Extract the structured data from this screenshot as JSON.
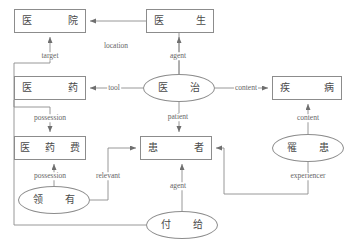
{
  "diagram": {
    "colors": {
      "stroke": "#8c8c8c",
      "node_text": "#4a4a4a",
      "label_text": "#666666",
      "background": "#ffffff"
    },
    "nodes": [
      {
        "id": "hospital",
        "shape": "box",
        "text": "医 院",
        "chars": [
          "医",
          "院"
        ],
        "x": 14,
        "y": 9,
        "w": 72,
        "h": 24
      },
      {
        "id": "doctor",
        "shape": "box",
        "text": "医 生",
        "chars": [
          "医",
          "生"
        ],
        "x": 146,
        "y": 9,
        "w": 68,
        "h": 24
      },
      {
        "id": "medicine",
        "shape": "box",
        "text": "医 药",
        "chars": [
          "医",
          "药"
        ],
        "x": 14,
        "y": 76,
        "w": 72,
        "h": 24
      },
      {
        "id": "treat",
        "shape": "ellipse",
        "text": "医 治",
        "chars": [
          "医",
          "治"
        ],
        "x": 143,
        "y": 74,
        "w": 72,
        "h": 28
      },
      {
        "id": "disease",
        "shape": "box",
        "text": "疾 病",
        "chars": [
          "疾",
          "病"
        ],
        "x": 272,
        "y": 76,
        "w": 70,
        "h": 24
      },
      {
        "id": "medfee",
        "shape": "box",
        "text": "医 药 费",
        "chars": [
          "医",
          "药",
          "费"
        ],
        "x": 14,
        "y": 136,
        "w": 72,
        "h": 24
      },
      {
        "id": "patientn",
        "shape": "box",
        "text": "患 者",
        "chars": [
          "患",
          "者"
        ],
        "x": 140,
        "y": 136,
        "w": 72,
        "h": 24
      },
      {
        "id": "suffer",
        "shape": "ellipse",
        "text": "罹 患",
        "chars": [
          "罹",
          "患"
        ],
        "x": 272,
        "y": 134,
        "w": 72,
        "h": 28
      },
      {
        "id": "possess",
        "shape": "ellipse",
        "text": "领 有",
        "chars": [
          "领",
          "有"
        ],
        "x": 18,
        "y": 186,
        "w": 72,
        "h": 28
      },
      {
        "id": "payto",
        "shape": "ellipse",
        "text": "付 给",
        "chars": [
          "付",
          "给"
        ],
        "x": 146,
        "y": 211,
        "w": 72,
        "h": 28
      }
    ],
    "edge_labels": [
      {
        "id": "target",
        "text": "target",
        "x": 50,
        "y": 56
      },
      {
        "id": "location",
        "text": "location",
        "x": 116,
        "y": 46
      },
      {
        "id": "agent-top",
        "text": "agent",
        "x": 178,
        "y": 56
      },
      {
        "id": "tool",
        "text": "tool",
        "x": 114,
        "y": 88
      },
      {
        "id": "content-mid",
        "text": "content",
        "x": 246,
        "y": 88
      },
      {
        "id": "patient",
        "text": "patient",
        "x": 178,
        "y": 117
      },
      {
        "id": "possession1",
        "text": "possession",
        "x": 50,
        "y": 118
      },
      {
        "id": "content-rt",
        "text": "content",
        "x": 308,
        "y": 118
      },
      {
        "id": "possession2",
        "text": "possession",
        "x": 50,
        "y": 176
      },
      {
        "id": "relevant",
        "text": "relevant",
        "x": 108,
        "y": 176
      },
      {
        "id": "agent-bot",
        "text": "agent",
        "x": 178,
        "y": 186
      },
      {
        "id": "experiencer",
        "text": "experiencer",
        "x": 308,
        "y": 176
      }
    ],
    "edges": [
      {
        "id": "treat-to-hospital",
        "label": "location",
        "from": "treat",
        "to": "hospital"
      },
      {
        "id": "payto-to-hospital",
        "label": "target",
        "from": "payto",
        "to": "hospital"
      },
      {
        "id": "treat-to-doctor",
        "label": "agent",
        "from": "treat",
        "to": "doctor"
      },
      {
        "id": "treat-to-medicine",
        "label": "tool",
        "from": "treat",
        "to": "medicine"
      },
      {
        "id": "treat-to-disease",
        "label": "content",
        "from": "treat",
        "to": "disease"
      },
      {
        "id": "treat-to-patient",
        "label": "patient",
        "from": "treat",
        "to": "patientn"
      },
      {
        "id": "medicine-to-medfee",
        "label": "possession",
        "from": "medicine",
        "to": "medfee"
      },
      {
        "id": "possess-to-medfee",
        "label": "possession",
        "from": "possess",
        "to": "medfee"
      },
      {
        "id": "possess-to-patient",
        "label": "relevant",
        "from": "possess",
        "to": "patientn"
      },
      {
        "id": "payto-to-patient",
        "label": "agent",
        "from": "payto",
        "to": "patientn"
      },
      {
        "id": "suffer-to-disease",
        "label": "content",
        "from": "suffer",
        "to": "disease"
      },
      {
        "id": "suffer-to-patient",
        "label": "experiencer",
        "from": "suffer",
        "to": "patientn"
      }
    ]
  }
}
